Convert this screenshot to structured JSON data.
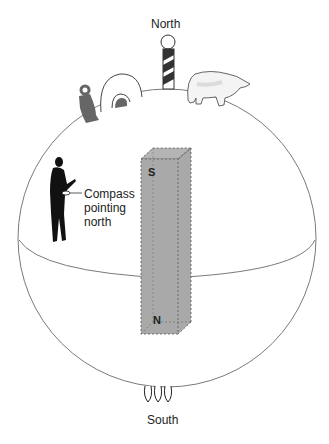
{
  "diagram": {
    "labels": {
      "north": "North",
      "south": "South",
      "compass_line1": "Compass",
      "compass_line2": "pointing",
      "compass_line3": "north",
      "magnet_top_pole": "S",
      "magnet_bottom_pole": "N"
    },
    "elements": [
      {
        "name": "globe",
        "type": "sphere-outline"
      },
      {
        "name": "equator",
        "type": "curve"
      },
      {
        "name": "bar-magnet",
        "type": "dashed-box",
        "color": "#a9a9a9"
      },
      {
        "name": "north-pole-marker",
        "type": "striped-pole"
      },
      {
        "name": "igloo",
        "type": "icon"
      },
      {
        "name": "eskimo",
        "type": "icon"
      },
      {
        "name": "polar-bear",
        "type": "icon"
      },
      {
        "name": "person-with-compass",
        "type": "silhouette"
      },
      {
        "name": "penguins",
        "type": "icon",
        "count": 3
      }
    ],
    "colors": {
      "outline": "#777777",
      "magnet_fill": "#a9a9a9",
      "silhouette": "#111111",
      "eskimo": "#666666"
    }
  }
}
